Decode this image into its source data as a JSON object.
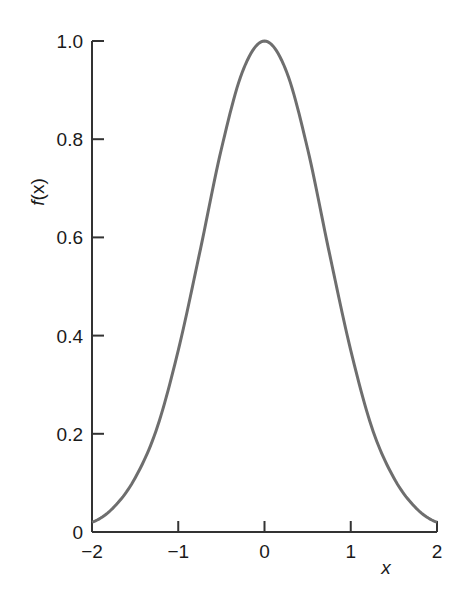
{
  "chart_data": {
    "type": "line",
    "title": "",
    "xlabel": "x",
    "ylabel": "f(x)",
    "xlim": [
      -2,
      2
    ],
    "ylim": [
      0,
      1.0
    ],
    "grid": false,
    "legend": null,
    "x_ticks": [
      -2,
      -1,
      0,
      1,
      2
    ],
    "x_tick_labels": [
      "−2",
      "−1",
      "0",
      "1",
      "2"
    ],
    "y_ticks": [
      0,
      0.2,
      0.4,
      0.6,
      0.8,
      1.0
    ],
    "y_tick_labels": [
      "0",
      "0.2",
      "0.4",
      "0.6",
      "0.8",
      "1.0"
    ],
    "series": [
      {
        "name": "f(x)",
        "color": "#6e6e6e",
        "x": [
          -2.0,
          -1.75,
          -1.5,
          -1.25,
          -1.0,
          -0.75,
          -0.5,
          -0.25,
          0.0,
          0.25,
          0.5,
          0.75,
          1.0,
          1.25,
          1.5,
          1.75,
          2.0
        ],
        "y": [
          0.02,
          0.05,
          0.11,
          0.21,
          0.37,
          0.57,
          0.78,
          0.94,
          1.0,
          0.94,
          0.78,
          0.57,
          0.37,
          0.21,
          0.11,
          0.05,
          0.02
        ]
      }
    ]
  },
  "labels": {
    "ylabel_italic": "f",
    "ylabel_rest": "(x)",
    "xlabel": "x"
  }
}
